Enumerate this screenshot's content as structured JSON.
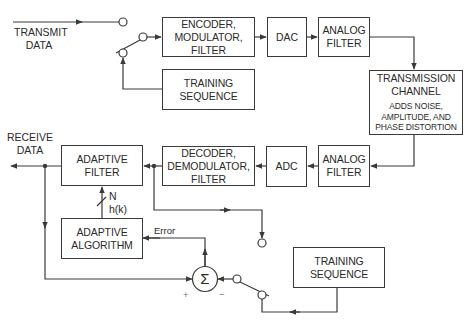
{
  "diagram": {
    "type": "adaptive-equalizer-block-diagram",
    "labels": {
      "transmit_data": "TRANSMIT\nDATA",
      "transmit_line1": "TRANSMIT",
      "transmit_line2": "DATA",
      "receive_line1": "RECEIVE",
      "receive_line2": "DATA",
      "tap_count": "N",
      "coefficients": "h(k)",
      "error": "Error",
      "plus": "+",
      "minus": "−",
      "sigma": "Σ"
    },
    "blocks": {
      "encoder": [
        "ENCODER,",
        "MODULATOR,",
        "FILTER"
      ],
      "dac": [
        "DAC"
      ],
      "analog_filter_tx": [
        "ANALOG",
        "FILTER"
      ],
      "training_tx": [
        "TRAINING",
        "SEQUENCE"
      ],
      "channel_title": [
        "TRANSMISSION",
        "CHANNEL"
      ],
      "channel_note": [
        "ADDS NOISE,",
        "AMPLITUDE, AND",
        "PHASE DISTORTION"
      ],
      "analog_filter_rx": [
        "ANALOG",
        "FILTER"
      ],
      "adc": [
        "ADC"
      ],
      "decoder": [
        "DECODER,",
        "DEMODULATOR,",
        "FILTER"
      ],
      "adaptive_filter": [
        "ADAPTIVE",
        "FILTER"
      ],
      "adaptive_algorithm": [
        "ADAPTIVE",
        "ALGORITHM"
      ],
      "training_rx": [
        "TRAINING",
        "SEQUENCE"
      ]
    },
    "colors": {
      "line": "#3a3a3a",
      "background": "#ffffff"
    }
  }
}
